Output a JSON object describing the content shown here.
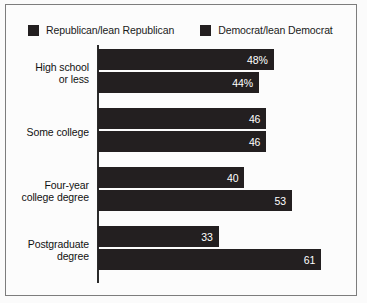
{
  "chart_data": {
    "type": "bar",
    "orientation": "horizontal",
    "title": "",
    "subtitle": "",
    "xlabel": "",
    "ylabel": "",
    "grid": false,
    "legend_position": "top-left",
    "xlim": [
      0,
      61
    ],
    "categories": [
      "High school\nor less",
      "Some college",
      "Four-year\ncollege degree",
      "Postgraduate\ndegree"
    ],
    "series": [
      {
        "name": "Republican/lean Republican",
        "color": "#231f20",
        "values": [
          48,
          46,
          40,
          33
        ],
        "labels": [
          "48%",
          "46",
          "40",
          "33"
        ]
      },
      {
        "name": "Democrat/lean Democrat",
        "color": "#231f20",
        "values": [
          44,
          46,
          53,
          61
        ],
        "labels": [
          "44%",
          "46",
          "53",
          "61"
        ]
      }
    ]
  },
  "legend": {
    "items": [
      {
        "label": "Republican/lean Republican",
        "swatch": "legend-swatch-republican"
      },
      {
        "label": "Democrat/lean Democrat",
        "swatch": "legend-swatch-democrat"
      }
    ]
  },
  "axis": {
    "category_labels": [
      {
        "line1": "High school",
        "line2": "or less"
      },
      {
        "line1": "Some college",
        "line2": ""
      },
      {
        "line1": "Four-year",
        "line2": "college degree"
      },
      {
        "line1": "Postgraduate",
        "line2": "degree"
      }
    ]
  },
  "colors": {
    "bar": "#231f20",
    "axis": "#2b2b2b",
    "frame": "#7d7d7d",
    "background": "#fcfcfc",
    "value_text": "#ffffff"
  }
}
